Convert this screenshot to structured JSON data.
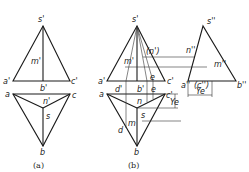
{
  "figure_a": {
    "caption": "(a)",
    "front_view": {
      "apex": "s'",
      "left": "a'",
      "mid": "b'",
      "right": "c'",
      "point": "m'"
    },
    "top_view": {
      "left": "a",
      "right": "c",
      "bottom": "b",
      "center": "s",
      "point": "n'"
    }
  },
  "figure_b": {
    "caption": "(b)",
    "front_view": {
      "apex": "s'",
      "left": "a'",
      "right": "c'",
      "mid": "b'",
      "d": "d'",
      "e": "e",
      "m": "m'",
      "n": "(n')"
    },
    "top_view": {
      "left": "a",
      "right": "c'",
      "bottom": "b",
      "center": "s",
      "n": "n",
      "m": "m",
      "d": "d",
      "e": "e",
      "dim": "Ye"
    },
    "side_view": {
      "apex": "s''",
      "left": "a''",
      "right": "b''",
      "paren": "(c'')",
      "n": "n''",
      "m": "m''",
      "dim": "Ye"
    }
  }
}
